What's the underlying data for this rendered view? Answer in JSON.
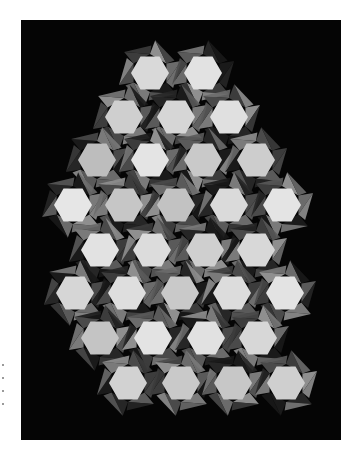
{
  "image": {
    "subject": "Black-and-white photograph of a quilt with a tessellated hexagon pattern on a black background",
    "background_color": "#ffffff",
    "quilt_background_color": "#050505"
  },
  "quilt": {
    "bounds": {
      "x": 21,
      "y": 20,
      "width": 320,
      "height": 420
    },
    "hex_radius": 19,
    "rows": [
      {
        "y": 73,
        "centers": [
          150,
          203
        ],
        "tones": [
          "#d9d9d9",
          "#e2e2e2"
        ]
      },
      {
        "y": 117,
        "centers": [
          124,
          176,
          229
        ],
        "tones": [
          "#cfcfcf",
          "#d6d6d6",
          "#e0e0e0"
        ]
      },
      {
        "y": 160,
        "centers": [
          97,
          150,
          203,
          256
        ],
        "tones": [
          "#bdbdbd",
          "#e4e4e4",
          "#c9c9c9",
          "#cdcdcd"
        ]
      },
      {
        "y": 205,
        "centers": [
          73,
          124,
          176,
          229,
          282
        ],
        "tones": [
          "#e6e6e6",
          "#c6c6c6",
          "#c2c2c2",
          "#dadada",
          "#e4e4e4"
        ]
      },
      {
        "y": 250,
        "centers": [
          100,
          152,
          205,
          256
        ],
        "tones": [
          "#e2e2e2",
          "#dcdcdc",
          "#cfcfcf",
          "#d8d8d8"
        ]
      },
      {
        "y": 293,
        "centers": [
          75,
          127,
          180,
          232,
          285
        ],
        "tones": [
          "#d6d6d6",
          "#dedede",
          "#c9c9c9",
          "#dcdcdc",
          "#e3e3e3"
        ]
      },
      {
        "y": 338,
        "centers": [
          100,
          153,
          206,
          258
        ],
        "tones": [
          "#c4c4c4",
          "#e3e3e3",
          "#e1e1e1",
          "#d7d7d7"
        ]
      },
      {
        "y": 383,
        "centers": [
          128,
          181,
          233,
          286
        ],
        "tones": [
          "#d2d2d2",
          "#c9c9c9",
          "#c7c7c7",
          "#cfcfcf"
        ]
      }
    ],
    "triangle_tones": [
      "#1a1a1a",
      "#3c3c3c",
      "#5a5a5a",
      "#7a7a7a",
      "#8f8f8f",
      "#262626",
      "#4a4a4a",
      "#6b6b6b"
    ]
  },
  "caption_marks": {
    "count": 4
  }
}
